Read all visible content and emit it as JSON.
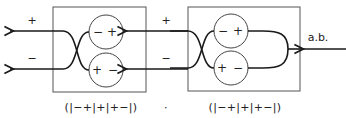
{
  "diagram": {
    "output_labels": {
      "top": "+",
      "bottom": "−"
    },
    "input_label": "a.b.",
    "stages": [
      {
        "cells": [
          {
            "left_sign": "−",
            "right_sign": "+"
          },
          {
            "left_sign": "+",
            "right_sign": "−"
          }
        ],
        "caption": "(|−+|+|+−|)"
      },
      {
        "cells": [
          {
            "left_sign": "−",
            "right_sign": "+"
          },
          {
            "left_sign": "+",
            "right_sign": "−"
          }
        ],
        "caption": "(|−+|+|+−|)"
      }
    ],
    "separator": "·",
    "middle_labels": {
      "top": "+",
      "bottom": "−"
    }
  }
}
